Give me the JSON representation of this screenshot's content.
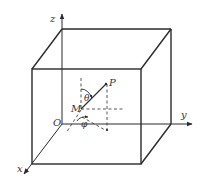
{
  "diagram": {
    "type": "3d-cube-coordinate-system",
    "colors": {
      "stroke": "#2a2a2a",
      "dashed": "#444444",
      "text": "#333333",
      "background": "#ffffff"
    },
    "axes": {
      "x": {
        "label": "x"
      },
      "y": {
        "label": "y"
      },
      "z": {
        "label": "z"
      }
    },
    "points": {
      "origin": {
        "label": "O"
      },
      "M": {
        "label": "M"
      },
      "P": {
        "label": "P"
      }
    },
    "angles": {
      "theta": {
        "label": "θ"
      },
      "phi": {
        "label": "φ"
      }
    }
  }
}
